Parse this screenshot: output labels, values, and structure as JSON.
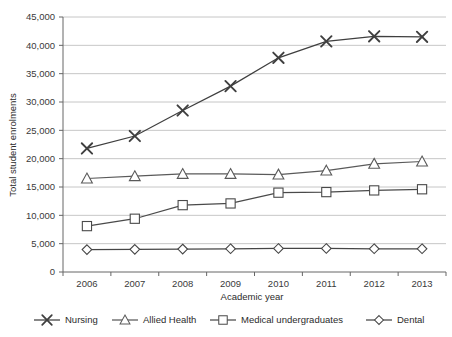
{
  "chart_data": {
    "type": "line",
    "title": "",
    "xlabel": "Academic year",
    "ylabel": "Total student enrolments",
    "categories": [
      "2006",
      "2007",
      "2008",
      "2009",
      "2010",
      "2011",
      "2012",
      "2013"
    ],
    "ylim": [
      0,
      45000
    ],
    "ytick_labels": [
      "0",
      "5,000",
      "10,000",
      "15,000",
      "20,000",
      "25,000",
      "30,000",
      "35,000",
      "40,000",
      "45,000"
    ],
    "ytick_values": [
      0,
      5000,
      10000,
      15000,
      20000,
      25000,
      30000,
      35000,
      40000,
      45000
    ],
    "grid": "horizontal",
    "legend_position": "bottom",
    "series": [
      {
        "name": "Nursing",
        "marker": "x-cross",
        "color": "#3f3f3f",
        "values": [
          21800,
          24000,
          28500,
          32800,
          37800,
          40700,
          41600,
          41500
        ]
      },
      {
        "name": "Allied Health",
        "marker": "triangle",
        "color": "#5a5a5a",
        "values": [
          16500,
          16900,
          17300,
          17300,
          17200,
          17900,
          19100,
          19500
        ]
      },
      {
        "name": "Medical undergraduates",
        "marker": "square",
        "color": "#4a4a4a",
        "values": [
          8100,
          9400,
          11800,
          12100,
          14000,
          14100,
          14400,
          14600
        ]
      },
      {
        "name": "Dental",
        "marker": "diamond",
        "color": "#454545",
        "values": [
          3950,
          4000,
          4050,
          4100,
          4150,
          4150,
          4100,
          4100
        ]
      }
    ]
  },
  "axes": {
    "y_title": "Total student enrolments",
    "x_title": "Academic year"
  },
  "legend": {
    "items": [
      {
        "label": "Nursing"
      },
      {
        "label": "Allied Health"
      },
      {
        "label": "Medical undergraduates"
      },
      {
        "label": "Dental"
      }
    ]
  },
  "style": {
    "plot_background": "#ffffff",
    "grid_color": "#b8b8b8",
    "axis_color": "#666666",
    "text_color": "#2b2b2b"
  }
}
